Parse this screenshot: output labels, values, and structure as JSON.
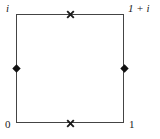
{
  "figure": {
    "background_color": "#ffffff",
    "stroke_color": "#444444",
    "text_color": "#1a1a1a",
    "vertices": {
      "bottom_left": "0",
      "bottom_right": "1",
      "top_left": "i",
      "top_right": "1 + i"
    },
    "markers": [
      {
        "name": "top-edge-cross",
        "glyph": "x",
        "position": "midpoint of top edge"
      },
      {
        "name": "bottom-edge-cross",
        "glyph": "x",
        "position": "midpoint of bottom edge"
      },
      {
        "name": "left-edge-dot",
        "glyph": "diamond",
        "position": "midpoint of left edge"
      },
      {
        "name": "right-edge-dot",
        "glyph": "diamond",
        "position": "midpoint of right edge"
      }
    ]
  }
}
